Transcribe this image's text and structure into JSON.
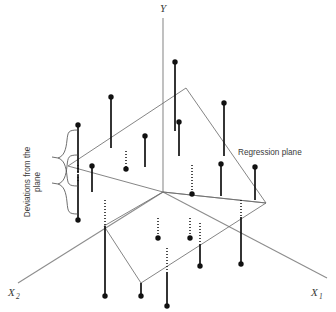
{
  "figure": {
    "type": "3d-scatter-regression-plane",
    "width": 336,
    "height": 312,
    "background_color": "#ffffff",
    "line_color": "#6f6f6f",
    "axis_color": "#8d8d8d",
    "marker_color": "#111111",
    "text_color": "#3a3a3a"
  },
  "axes": {
    "y": {
      "label": "Y",
      "subscript": "",
      "label_x": 160,
      "label_y": 11
    },
    "x1": {
      "label": "X",
      "subscript": "1",
      "label_x": 311,
      "label_y": 296
    },
    "x2": {
      "label": "X",
      "subscript": "2",
      "label_x": 8,
      "label_y": 296
    },
    "y_axis_line": {
      "x1": 163,
      "y1": 18,
      "x2": 163,
      "y2": 192
    },
    "x1_axis_line": {
      "x1": 163,
      "y1": 192,
      "x2": 327,
      "y2": 278
    },
    "x2_axis_line": {
      "x1": 163,
      "y1": 192,
      "x2": 18,
      "y2": 283
    }
  },
  "annotations": [
    {
      "name": "regression-plane-label",
      "text": "Regression plane",
      "x": 238,
      "y": 152,
      "rotation": 0
    },
    {
      "name": "deviations-label",
      "text_line_1": "Deviations from the",
      "text_line_2": "plane",
      "x": 30,
      "y": 182,
      "rotation": -90
    }
  ],
  "regression_plane": {
    "name": "regression-plane",
    "vertices": [
      {
        "x": 68,
        "y": 166
      },
      {
        "x": 186,
        "y": 88
      },
      {
        "x": 266,
        "y": 203
      },
      {
        "x": 163,
        "y": 192
      }
    ]
  },
  "base_plane": {
    "name": "base-plane",
    "vertices": [
      {
        "x": 104,
        "y": 226
      },
      {
        "x": 163,
        "y": 192
      },
      {
        "x": 266,
        "y": 203
      },
      {
        "x": 141,
        "y": 283
      }
    ]
  },
  "brace": {
    "name": "deviations-brace",
    "outer_top_x": 78,
    "outer_top_y": 130,
    "outer_bottom_y": 220,
    "mid_x": 58,
    "tip_x": 50
  },
  "observations": [
    {
      "id": 1,
      "x": 175,
      "top_y": 62,
      "bottom_y": 131,
      "style": "solid",
      "dot_at": "top"
    },
    {
      "id": 2,
      "x": 111,
      "top_y": 97,
      "bottom_y": 148,
      "style": "solid",
      "dot_at": "top"
    },
    {
      "id": 3,
      "x": 78,
      "top_y": 125,
      "bottom_y": 173,
      "style": "solid",
      "dot_at": "top"
    },
    {
      "id": 4,
      "x": 224,
      "top_y": 103,
      "bottom_y": 156,
      "style": "solid",
      "dot_at": "top"
    },
    {
      "id": 5,
      "x": 179,
      "top_y": 122,
      "bottom_y": 156,
      "style": "solid",
      "dot_at": "top"
    },
    {
      "id": 6,
      "x": 145,
      "top_y": 136,
      "bottom_y": 167,
      "style": "solid",
      "dot_at": "top"
    },
    {
      "id": 7,
      "x": 92,
      "top_y": 166,
      "bottom_y": 192,
      "style": "solid",
      "dot_at": "top"
    },
    {
      "id": 8,
      "x": 221,
      "top_y": 164,
      "bottom_y": 196,
      "style": "solid",
      "dot_at": "top"
    },
    {
      "id": 9,
      "x": 255,
      "top_y": 167,
      "bottom_y": 200,
      "style": "solid",
      "dot_at": "top"
    },
    {
      "id": 10,
      "x": 78,
      "top_y": 175,
      "bottom_y": 220,
      "style": "solid",
      "dot_at": "bottom"
    },
    {
      "id": 11,
      "x": 126,
      "top_y": 151,
      "bottom_y": 169,
      "style": "dotted",
      "dot_at": "bottom"
    },
    {
      "id": 12,
      "x": 192,
      "top_y": 165,
      "bottom_y": 194,
      "style": "dotted",
      "dot_at": "bottom"
    },
    {
      "id": 13,
      "x": 78,
      "top_y": 165,
      "bottom_y": 182,
      "style": "dotted",
      "dot_at": "none"
    },
    {
      "id": 14,
      "x": 105,
      "top_y": 200,
      "bottom_y": 226,
      "style": "dotted",
      "dot_at": "none"
    },
    {
      "id": 15,
      "x": 105,
      "top_y": 226,
      "bottom_y": 296,
      "style": "solid",
      "dot_at": "bottom"
    },
    {
      "id": 16,
      "x": 158,
      "top_y": 218,
      "bottom_y": 238,
      "style": "dotted",
      "dot_at": "bottom"
    },
    {
      "id": 17,
      "x": 190,
      "top_y": 218,
      "bottom_y": 238,
      "style": "dotted",
      "dot_at": "bottom"
    },
    {
      "id": 18,
      "x": 200,
      "top_y": 223,
      "bottom_y": 244,
      "style": "dotted",
      "dot_at": "none"
    },
    {
      "id": 19,
      "x": 200,
      "top_y": 244,
      "bottom_y": 266,
      "style": "solid",
      "dot_at": "bottom"
    },
    {
      "id": 20,
      "x": 167,
      "top_y": 248,
      "bottom_y": 272,
      "style": "dotted",
      "dot_at": "none"
    },
    {
      "id": 21,
      "x": 167,
      "top_y": 272,
      "bottom_y": 306,
      "style": "solid",
      "dot_at": "bottom"
    },
    {
      "id": 22,
      "x": 241,
      "top_y": 200,
      "bottom_y": 217,
      "style": "dotted",
      "dot_at": "none"
    },
    {
      "id": 23,
      "x": 241,
      "top_y": 217,
      "bottom_y": 264,
      "style": "solid",
      "dot_at": "bottom"
    },
    {
      "id": 24,
      "x": 141,
      "top_y": 283,
      "bottom_y": 296,
      "style": "solid",
      "dot_at": "bottom"
    }
  ],
  "dot_radius": 2.7
}
